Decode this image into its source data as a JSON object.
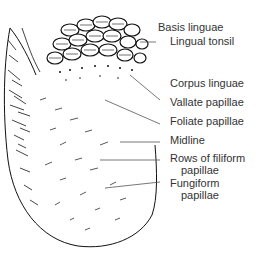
{
  "figure": {
    "colors": {
      "ink": "#111111",
      "label_text": "#333333",
      "background": "#ffffff"
    },
    "labels": [
      {
        "id": "basis",
        "text": "Basis linguae",
        "x": 158,
        "y": 26
      },
      {
        "id": "tonsil",
        "text": "Lingual tonsil",
        "x": 170,
        "y": 40
      },
      {
        "id": "corpus",
        "text": "Corpus linguae",
        "x": 170,
        "y": 82
      },
      {
        "id": "vallate",
        "text": "Vallate papillae",
        "x": 170,
        "y": 102
      },
      {
        "id": "foliate",
        "text": "Foliate papillae",
        "x": 170,
        "y": 120
      },
      {
        "id": "midline",
        "text": "Midline",
        "x": 170,
        "y": 138
      },
      {
        "id": "rows1",
        "text": "Rows of filiform",
        "x": 170,
        "y": 156
      },
      {
        "id": "rows2",
        "text": "papillae",
        "x": 181,
        "y": 168
      },
      {
        "id": "fung1",
        "text": "Fungiform",
        "x": 170,
        "y": 182
      },
      {
        "id": "fung2",
        "text": "papillae",
        "x": 181,
        "y": 194
      }
    ]
  }
}
